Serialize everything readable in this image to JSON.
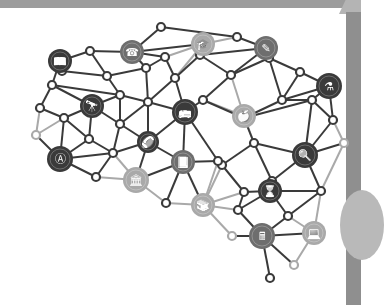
{
  "illustration": {
    "title": "Education knowledge network",
    "colors": {
      "dark": "#3a3a3a",
      "mid": "#6e6e6e",
      "light": "#a9a9a9",
      "frame": "#9c9c9c",
      "panel": "#8f8f8f"
    },
    "nodes": [
      {
        "id": "n1",
        "x": 161,
        "y": 27,
        "r": 4,
        "c": "dark"
      },
      {
        "id": "n2",
        "x": 90,
        "y": 51,
        "r": 4,
        "c": "dark"
      },
      {
        "id": "n3",
        "x": 237,
        "y": 37,
        "r": 4,
        "c": "dark"
      },
      {
        "id": "n4",
        "x": 62,
        "y": 71,
        "r": 4,
        "c": "dark"
      },
      {
        "id": "n5",
        "x": 107,
        "y": 76,
        "r": 4,
        "c": "dark"
      },
      {
        "id": "n6",
        "x": 146,
        "y": 68,
        "r": 4,
        "c": "dark"
      },
      {
        "id": "n7",
        "x": 165,
        "y": 57,
        "r": 4,
        "c": "dark"
      },
      {
        "id": "n8",
        "x": 175,
        "y": 78,
        "r": 4,
        "c": "dark"
      },
      {
        "id": "n9",
        "x": 200,
        "y": 55,
        "r": 4,
        "c": "dark"
      },
      {
        "id": "n10",
        "x": 231,
        "y": 75,
        "r": 4,
        "c": "dark"
      },
      {
        "id": "n11",
        "x": 269,
        "y": 58,
        "r": 4,
        "c": "dark"
      },
      {
        "id": "n12",
        "x": 300,
        "y": 72,
        "r": 4,
        "c": "dark"
      },
      {
        "id": "n13",
        "x": 52,
        "y": 85,
        "r": 4,
        "c": "dark"
      },
      {
        "id": "n14",
        "x": 40,
        "y": 108,
        "r": 4,
        "c": "dark"
      },
      {
        "id": "n15",
        "x": 64,
        "y": 118,
        "r": 4,
        "c": "dark"
      },
      {
        "id": "n16",
        "x": 120,
        "y": 95,
        "r": 4,
        "c": "dark"
      },
      {
        "id": "n17",
        "x": 148,
        "y": 102,
        "r": 4,
        "c": "dark"
      },
      {
        "id": "n18",
        "x": 203,
        "y": 100,
        "r": 4,
        "c": "dark"
      },
      {
        "id": "n19",
        "x": 282,
        "y": 100,
        "r": 4,
        "c": "dark"
      },
      {
        "id": "n20",
        "x": 36,
        "y": 135,
        "r": 4,
        "c": "light"
      },
      {
        "id": "n21",
        "x": 89,
        "y": 139,
        "r": 4,
        "c": "dark"
      },
      {
        "id": "n22",
        "x": 120,
        "y": 124,
        "r": 4,
        "c": "dark"
      },
      {
        "id": "n23",
        "x": 244,
        "y": 118,
        "r": 4,
        "c": "dark"
      },
      {
        "id": "n24",
        "x": 254,
        "y": 143,
        "r": 4,
        "c": "dark"
      },
      {
        "id": "n25",
        "x": 312,
        "y": 100,
        "r": 4,
        "c": "dark"
      },
      {
        "id": "n26",
        "x": 333,
        "y": 120,
        "r": 4,
        "c": "dark"
      },
      {
        "id": "n27",
        "x": 344,
        "y": 143,
        "r": 4,
        "c": "light"
      },
      {
        "id": "n28",
        "x": 113,
        "y": 153,
        "r": 4,
        "c": "dark"
      },
      {
        "id": "n29",
        "x": 96,
        "y": 177,
        "r": 4,
        "c": "dark"
      },
      {
        "id": "n30",
        "x": 222,
        "y": 165,
        "r": 4,
        "c": "dark"
      },
      {
        "id": "n31",
        "x": 244,
        "y": 192,
        "r": 4,
        "c": "dark"
      },
      {
        "id": "n32",
        "x": 272,
        "y": 181,
        "r": 4,
        "c": "dark"
      },
      {
        "id": "n33",
        "x": 218,
        "y": 161,
        "r": 4,
        "c": "dark"
      },
      {
        "id": "n34",
        "x": 321,
        "y": 191,
        "r": 4,
        "c": "dark"
      },
      {
        "id": "n35",
        "x": 238,
        "y": 210,
        "r": 4,
        "c": "dark"
      },
      {
        "id": "n36",
        "x": 166,
        "y": 203,
        "r": 4,
        "c": "dark"
      },
      {
        "id": "n37",
        "x": 288,
        "y": 216,
        "r": 4,
        "c": "dark"
      },
      {
        "id": "n38",
        "x": 232,
        "y": 236,
        "r": 4,
        "c": "light"
      },
      {
        "id": "n39",
        "x": 294,
        "y": 265,
        "r": 4,
        "c": "light"
      },
      {
        "id": "n40",
        "x": 270,
        "y": 278,
        "r": 4,
        "c": "dark"
      }
    ],
    "icons": [
      {
        "id": "reading",
        "name": "reading-book-icon",
        "x": 60,
        "y": 61,
        "r": 12,
        "c": "dark",
        "glyph": "📖"
      },
      {
        "id": "headset",
        "name": "headset-person-icon",
        "x": 132,
        "y": 52,
        "r": 12,
        "c": "mid",
        "glyph": "☎"
      },
      {
        "id": "graduation",
        "name": "graduation-cap-icon",
        "x": 203,
        "y": 44,
        "r": 12,
        "c": "light",
        "glyph": "🎓"
      },
      {
        "id": "pencil",
        "name": "pencil-icon",
        "x": 266,
        "y": 48,
        "r": 12,
        "c": "mid",
        "glyph": "✎"
      },
      {
        "id": "flask",
        "name": "flask-icon",
        "x": 329,
        "y": 86,
        "r": 13,
        "c": "dark",
        "glyph": "⚗"
      },
      {
        "id": "telescope",
        "name": "telescope-icon",
        "x": 92,
        "y": 106,
        "r": 12,
        "c": "dark",
        "glyph": "🔭"
      },
      {
        "id": "bus",
        "name": "school-bus-icon",
        "x": 185,
        "y": 112,
        "r": 13,
        "c": "dark",
        "glyph": "🚌"
      },
      {
        "id": "apple",
        "name": "apple-icon",
        "x": 244,
        "y": 116,
        "r": 12,
        "c": "light",
        "glyph": "🍎"
      },
      {
        "id": "football",
        "name": "football-icon",
        "x": 148,
        "y": 142,
        "r": 11,
        "c": "dark",
        "glyph": "🏈"
      },
      {
        "id": "magnifier",
        "name": "magnifier-icon",
        "x": 305,
        "y": 155,
        "r": 13,
        "c": "dark",
        "glyph": "🔍"
      },
      {
        "id": "abc",
        "name": "abc-search-icon",
        "x": 60,
        "y": 159,
        "r": 13,
        "c": "dark",
        "glyph": "Ⓐ"
      },
      {
        "id": "book-open",
        "name": "open-book-icon",
        "x": 183,
        "y": 162,
        "r": 12,
        "c": "mid",
        "glyph": "📘"
      },
      {
        "id": "museum",
        "name": "museum-building-icon",
        "x": 136,
        "y": 180,
        "r": 13,
        "c": "light",
        "glyph": "🏛"
      },
      {
        "id": "hourglass",
        "name": "hourglass-icon",
        "x": 270,
        "y": 191,
        "r": 12,
        "c": "dark",
        "glyph": "⌛"
      },
      {
        "id": "books",
        "name": "stack-of-books-icon",
        "x": 203,
        "y": 205,
        "r": 12,
        "c": "light",
        "glyph": "📚"
      },
      {
        "id": "calculator",
        "name": "calculator-icon",
        "x": 262,
        "y": 236,
        "r": 13,
        "c": "mid",
        "glyph": "🖩"
      },
      {
        "id": "laptop",
        "name": "laptop-icon",
        "x": 314,
        "y": 233,
        "r": 12,
        "c": "light",
        "glyph": "💻"
      }
    ],
    "edges": [
      [
        "n1",
        "headset"
      ],
      [
        "n1",
        "n3"
      ],
      [
        "headset",
        "n2"
      ],
      [
        "headset",
        "n7"
      ],
      [
        "headset",
        "graduation"
      ],
      [
        "headset",
        "n6"
      ],
      [
        "n2",
        "reading"
      ],
      [
        "n2",
        "n5"
      ],
      [
        "reading",
        "n13"
      ],
      [
        "reading",
        "n4"
      ],
      [
        "n4",
        "n5"
      ],
      [
        "n5",
        "n6"
      ],
      [
        "n5",
        "n16"
      ],
      [
        "n6",
        "n7"
      ],
      [
        "n6",
        "n17"
      ],
      [
        "n7",
        "graduation"
      ],
      [
        "n7",
        "n8"
      ],
      [
        "n8",
        "graduation"
      ],
      [
        "n8",
        "n9"
      ],
      [
        "n8",
        "n17"
      ],
      [
        "n8",
        "bus"
      ],
      [
        "graduation",
        "n9"
      ],
      [
        "graduation",
        "n3"
      ],
      [
        "n9",
        "n10"
      ],
      [
        "n9",
        "pencil"
      ],
      [
        "n3",
        "pencil"
      ],
      [
        "pencil",
        "n10"
      ],
      [
        "pencil",
        "n11"
      ],
      [
        "n10",
        "n11"
      ],
      [
        "n10",
        "n18"
      ],
      [
        "n10",
        "apple"
      ],
      [
        "n11",
        "n12"
      ],
      [
        "n11",
        "n19"
      ],
      [
        "n12",
        "flask"
      ],
      [
        "n12",
        "n19"
      ],
      [
        "n13",
        "n14"
      ],
      [
        "n13",
        "n16"
      ],
      [
        "n13",
        "telescope"
      ],
      [
        "n14",
        "n15"
      ],
      [
        "n14",
        "n20"
      ],
      [
        "n15",
        "telescope"
      ],
      [
        "n15",
        "n20"
      ],
      [
        "n15",
        "abc"
      ],
      [
        "n15",
        "n21"
      ],
      [
        "telescope",
        "n16"
      ],
      [
        "telescope",
        "n22"
      ],
      [
        "telescope",
        "n21"
      ],
      [
        "n16",
        "n17"
      ],
      [
        "n16",
        "n22"
      ],
      [
        "n17",
        "bus"
      ],
      [
        "n17",
        "n22"
      ],
      [
        "n17",
        "football"
      ],
      [
        "n18",
        "bus"
      ],
      [
        "n18",
        "apple"
      ],
      [
        "n18",
        "n23"
      ],
      [
        "n19",
        "n23"
      ],
      [
        "n19",
        "flask"
      ],
      [
        "n19",
        "n25"
      ],
      [
        "flask",
        "n25"
      ],
      [
        "flask",
        "n26"
      ],
      [
        "n20",
        "abc"
      ],
      [
        "n21",
        "abc"
      ],
      [
        "n21",
        "n28"
      ],
      [
        "n22",
        "n28"
      ],
      [
        "n22",
        "football"
      ],
      [
        "n28",
        "football"
      ],
      [
        "n28",
        "museum"
      ],
      [
        "n28",
        "abc"
      ],
      [
        "abc",
        "n29"
      ],
      [
        "n29",
        "museum"
      ],
      [
        "n29",
        "n28"
      ],
      [
        "bus",
        "football"
      ],
      [
        "bus",
        "book-open"
      ],
      [
        "bus",
        "n33"
      ],
      [
        "apple",
        "n23"
      ],
      [
        "apple",
        "n24"
      ],
      [
        "football",
        "book-open"
      ],
      [
        "football",
        "museum"
      ],
      [
        "museum",
        "book-open"
      ],
      [
        "museum",
        "n36"
      ],
      [
        "book-open",
        "n33"
      ],
      [
        "book-open",
        "books"
      ],
      [
        "book-open",
        "n36"
      ],
      [
        "n23",
        "n24"
      ],
      [
        "n23",
        "n25"
      ],
      [
        "n24",
        "n30"
      ],
      [
        "n24",
        "n32"
      ],
      [
        "n24",
        "magnifier"
      ],
      [
        "n25",
        "n26"
      ],
      [
        "n25",
        "magnifier"
      ],
      [
        "n26",
        "n27"
      ],
      [
        "n26",
        "magnifier"
      ],
      [
        "n27",
        "magnifier"
      ],
      [
        "n27",
        "n34"
      ],
      [
        "n33",
        "n30"
      ],
      [
        "n30",
        "n31"
      ],
      [
        "n30",
        "books"
      ],
      [
        "n33",
        "books"
      ],
      [
        "n31",
        "hourglass"
      ],
      [
        "n31",
        "n35"
      ],
      [
        "n31",
        "books"
      ],
      [
        "n32",
        "hourglass"
      ],
      [
        "n32",
        "magnifier"
      ],
      [
        "magnifier",
        "n34"
      ],
      [
        "n34",
        "hourglass"
      ],
      [
        "n34",
        "laptop"
      ],
      [
        "n34",
        "n37"
      ],
      [
        "hourglass",
        "n37"
      ],
      [
        "hourglass",
        "n35"
      ],
      [
        "n36",
        "books"
      ],
      [
        "books",
        "n35"
      ],
      [
        "books",
        "n38"
      ],
      [
        "n35",
        "calculator"
      ],
      [
        "n37",
        "calculator"
      ],
      [
        "n37",
        "laptop"
      ],
      [
        "n38",
        "calculator"
      ],
      [
        "calculator",
        "laptop"
      ],
      [
        "calculator",
        "n39"
      ],
      [
        "calculator",
        "n40"
      ],
      [
        "laptop",
        "n39"
      ]
    ]
  }
}
